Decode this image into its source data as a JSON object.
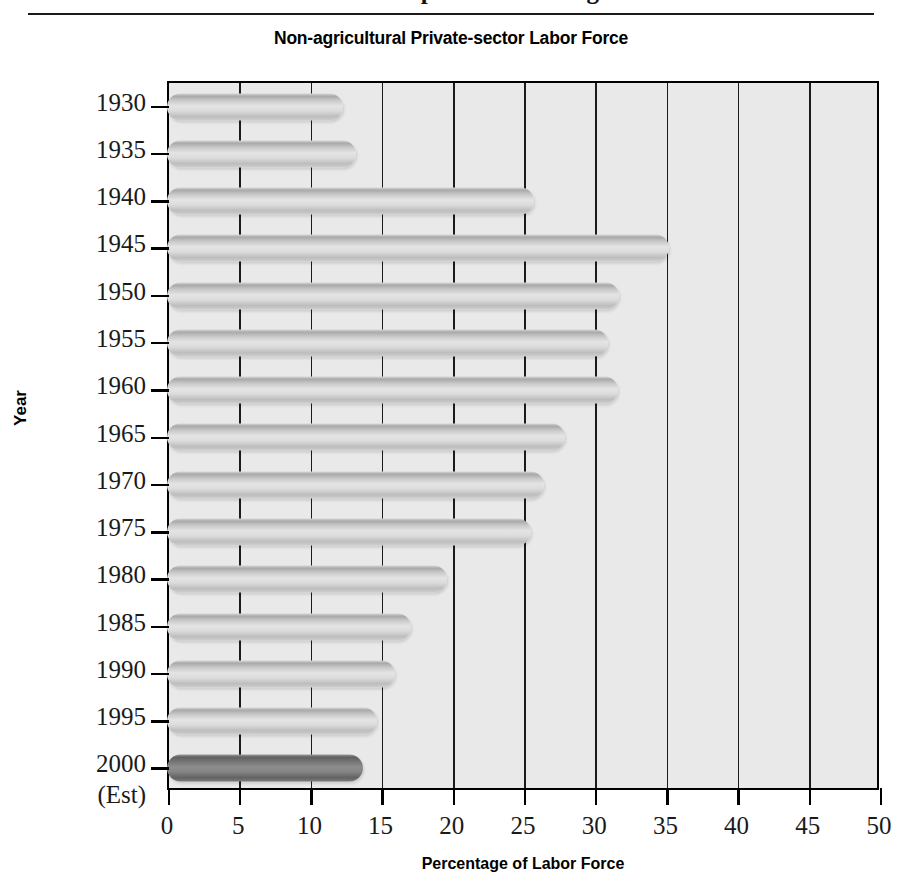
{
  "header": {
    "clipped_title": "Union Membership as a Percentage of the",
    "rule": "horizontal-rule"
  },
  "chart_data": {
    "type": "bar",
    "orientation": "horizontal",
    "title": "Non-agricultural Private-sector Labor Force",
    "xlabel": "Percentage of Labor Force",
    "ylabel": "Year",
    "xlim": [
      0,
      50
    ],
    "xticks": [
      0,
      5,
      10,
      15,
      20,
      25,
      30,
      35,
      40,
      45,
      50
    ],
    "xtick_labels": [
      "0",
      "5",
      "10",
      "15",
      "20",
      "25",
      "30",
      "35",
      "40",
      "45",
      "50"
    ],
    "grid": true,
    "legend": "none",
    "categories": [
      "1930",
      "1935",
      "1940",
      "1945",
      "1950",
      "1955",
      "1960",
      "1965",
      "1970",
      "1975",
      "1980",
      "1985",
      "1990",
      "1995",
      "2000"
    ],
    "category_sublabels": {
      "2000": "(Est)"
    },
    "values": [
      12.2,
      13.1,
      25.6,
      35.1,
      31.6,
      30.8,
      31.5,
      27.8,
      26.3,
      25.4,
      19.5,
      17.0,
      15.9,
      14.6,
      13.6
    ],
    "highlight_index": 14,
    "colors": {
      "bar_light": "#d0d0d0",
      "bar_highlight": "#7a7a7a",
      "plot_background": "#e9e9e9",
      "axis": "#000000",
      "gridline": "#1b1b1b"
    }
  }
}
